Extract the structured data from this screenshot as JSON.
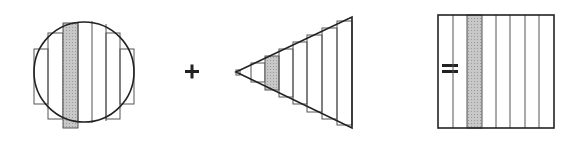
{
  "diagram": {
    "operators": {
      "plus": "+",
      "equals": "="
    },
    "colors": {
      "stroke": "#333333",
      "shade": "#bdbdbd",
      "background": "#ffffff"
    },
    "circle": {
      "cx": 84,
      "cy": 72,
      "r": 50,
      "strip_count": 7,
      "shaded_strip_index": 2
    },
    "triangle": {
      "apex_x": 236,
      "apex_y": 72,
      "base_x": 352,
      "base_top": 17,
      "base_bottom": 128,
      "strip_count": 8,
      "shaded_strip_index": 2
    },
    "square": {
      "x": 438,
      "y": 15,
      "w": 116,
      "h": 113,
      "strip_count": 8,
      "shaded_strip_index": 2
    }
  }
}
